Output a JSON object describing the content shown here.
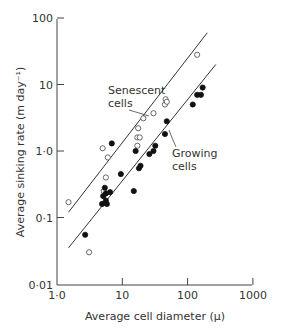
{
  "chart_data": {
    "type": "scatter",
    "title": "",
    "xlabel": "Average cell diameter (μ)",
    "ylabel": "Average sinking rate (m day⁻¹)",
    "xscale": "log",
    "yscale": "log",
    "xlim": [
      1.0,
      1000
    ],
    "ylim": [
      0.01,
      100
    ],
    "x_ticks": [
      "1·0",
      "10",
      "100",
      "1000"
    ],
    "y_ticks": [
      "0·01",
      "0·1",
      "1·0",
      "10",
      "100"
    ],
    "grid": false,
    "legend": null,
    "annotations": [
      {
        "text_line1": "Senescent",
        "text_line2": "cells",
        "target": "senescent-fit-line"
      },
      {
        "text_line1": "Growing",
        "text_line2": "cells",
        "target": "growing-fit-line"
      }
    ],
    "series": [
      {
        "name": "Senescent cells",
        "marker": "open-circle",
        "points": [
          [
            1.5,
            0.17
          ],
          [
            3.1,
            0.03
          ],
          [
            5.0,
            1.1
          ],
          [
            6.0,
            0.8
          ],
          [
            5.6,
            0.4
          ],
          [
            5.2,
            0.25
          ],
          [
            17,
            1.2
          ],
          [
            17,
            1.6
          ],
          [
            17.5,
            2.2
          ],
          [
            18.5,
            1.6
          ],
          [
            21,
            3.1
          ],
          [
            30,
            3.7
          ],
          [
            45,
            5.0
          ],
          [
            46,
            6.0
          ],
          [
            48,
            5.5
          ],
          [
            140,
            28
          ]
        ],
        "fit_line": [
          [
            1.5,
            0.12
          ],
          [
            200,
            60
          ]
        ]
      },
      {
        "name": "Growing cells",
        "marker": "filled-circle",
        "points": [
          [
            2.7,
            0.055
          ],
          [
            4.9,
            0.16
          ],
          [
            5.1,
            0.21
          ],
          [
            5.4,
            0.28
          ],
          [
            5.6,
            0.23
          ],
          [
            5.6,
            0.18
          ],
          [
            5.8,
            0.16
          ],
          [
            6.5,
            0.24
          ],
          [
            6.9,
            1.3
          ],
          [
            9.5,
            0.45
          ],
          [
            15,
            0.25
          ],
          [
            16,
            1.0
          ],
          [
            18,
            0.55
          ],
          [
            19,
            0.6
          ],
          [
            26,
            0.9
          ],
          [
            30,
            1.0
          ],
          [
            32,
            1.2
          ],
          [
            45,
            1.8
          ],
          [
            48,
            2.8
          ],
          [
            120,
            5.0
          ],
          [
            140,
            7.0
          ],
          [
            160,
            7.0
          ],
          [
            170,
            9.0
          ]
        ],
        "fit_line": [
          [
            1.5,
            0.035
          ],
          [
            270,
            20
          ]
        ]
      }
    ]
  }
}
